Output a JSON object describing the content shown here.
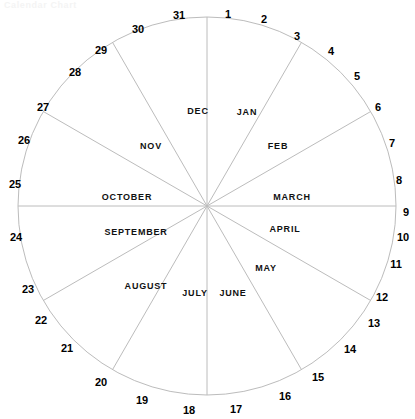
{
  "figure": {
    "caption": "Calendar Chart",
    "type": "circular-calendar-wheel",
    "center": {
      "x": 207,
      "y": 206
    },
    "radius": 189,
    "stroke_color": "#bcbcbc",
    "text_color": "#111111",
    "background": "#ffffff"
  },
  "chart_data": {
    "type": "pie",
    "title": "Calendar Chart",
    "xlabel": "",
    "ylabel": "",
    "legend_position": "none",
    "grid": false,
    "categories": [
      "JAN",
      "FEB",
      "MARCH",
      "APRIL",
      "MAY",
      "JUNE",
      "JULY",
      "AUGUST",
      "SEPTEMBER",
      "OCTOBER",
      "NOV",
      "DEC"
    ],
    "values": [
      30,
      30,
      30,
      30,
      30,
      30,
      30,
      30,
      30,
      30,
      30,
      30
    ],
    "start_angle_deg": 0,
    "direction": "clockwise",
    "rim_tick_labels": [
      "1",
      "2",
      "3",
      "4",
      "5",
      "6",
      "7",
      "8",
      "9",
      "10",
      "11",
      "12",
      "13",
      "14",
      "15",
      "16",
      "17",
      "18",
      "19",
      "20",
      "21",
      "22",
      "23",
      "24",
      "25",
      "26",
      "27",
      "28",
      "29",
      "30",
      "31"
    ],
    "rim_tick_count": 31,
    "annotations": []
  },
  "months": [
    {
      "name": "JAN",
      "x": 247,
      "y": 111
    },
    {
      "name": "FEB",
      "x": 278,
      "y": 145
    },
    {
      "name": "MARCH",
      "x": 292,
      "y": 196
    },
    {
      "name": "APRIL",
      "x": 285,
      "y": 228
    },
    {
      "name": "MAY",
      "x": 266,
      "y": 267
    },
    {
      "name": "JUNE",
      "x": 233,
      "y": 292
    },
    {
      "name": "JULY",
      "x": 195,
      "y": 292
    },
    {
      "name": "AUGUST",
      "x": 146,
      "y": 285
    },
    {
      "name": "SEPTEMBER",
      "x": 136,
      "y": 231
    },
    {
      "name": "OCTOBER",
      "x": 127,
      "y": 196
    },
    {
      "name": "NOV",
      "x": 151,
      "y": 145
    },
    {
      "name": "DEC",
      "x": 198,
      "y": 110
    }
  ],
  "days": [
    {
      "label": "1",
      "x": 228,
      "y": 14
    },
    {
      "label": "2",
      "x": 264,
      "y": 19
    },
    {
      "label": "3",
      "x": 297,
      "y": 36
    },
    {
      "label": "4",
      "x": 331,
      "y": 51
    },
    {
      "label": "5",
      "x": 357,
      "y": 76
    },
    {
      "label": "6",
      "x": 378,
      "y": 107
    },
    {
      "label": "7",
      "x": 392,
      "y": 143
    },
    {
      "label": "8",
      "x": 399,
      "y": 180
    },
    {
      "label": "9",
      "x": 406,
      "y": 212
    },
    {
      "label": "10",
      "x": 403,
      "y": 237
    },
    {
      "label": "11",
      "x": 396,
      "y": 264
    },
    {
      "label": "12",
      "x": 382,
      "y": 297
    },
    {
      "label": "13",
      "x": 374,
      "y": 323
    },
    {
      "label": "14",
      "x": 350,
      "y": 349
    },
    {
      "label": "15",
      "x": 318,
      "y": 377
    },
    {
      "label": "16",
      "x": 285,
      "y": 396
    },
    {
      "label": "17",
      "x": 236,
      "y": 409
    },
    {
      "label": "18",
      "x": 189,
      "y": 410
    },
    {
      "label": "19",
      "x": 142,
      "y": 400
    },
    {
      "label": "20",
      "x": 101,
      "y": 382
    },
    {
      "label": "21",
      "x": 67,
      "y": 348
    },
    {
      "label": "22",
      "x": 41,
      "y": 320
    },
    {
      "label": "23",
      "x": 28,
      "y": 289
    },
    {
      "label": "24",
      "x": 16,
      "y": 237
    },
    {
      "label": "25",
      "x": 15,
      "y": 184
    },
    {
      "label": "26",
      "x": 24,
      "y": 140
    },
    {
      "label": "27",
      "x": 43,
      "y": 107
    },
    {
      "label": "28",
      "x": 75,
      "y": 72
    },
    {
      "label": "29",
      "x": 101,
      "y": 50
    },
    {
      "label": "30",
      "x": 138,
      "y": 29
    },
    {
      "label": "31",
      "x": 179,
      "y": 15
    }
  ]
}
